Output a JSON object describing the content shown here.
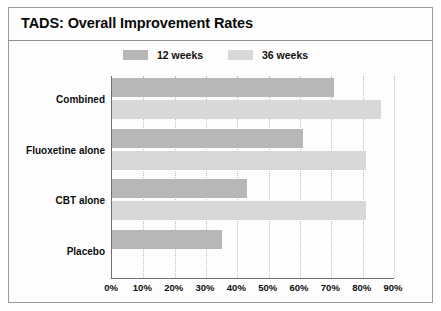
{
  "chart_data": {
    "type": "bar",
    "orientation": "horizontal",
    "title": "TADS: Overall Improvement Rates",
    "xlabel": "",
    "ylabel": "",
    "xlim": [
      0,
      90
    ],
    "xticks": [
      "0%",
      "10%",
      "20%",
      "30%",
      "40%",
      "50%",
      "60%",
      "70%",
      "80%",
      "90%"
    ],
    "xtick_values": [
      0,
      10,
      20,
      30,
      40,
      50,
      60,
      70,
      80,
      90
    ],
    "grid": "vertical-dotted",
    "legend_position": "top-center",
    "categories": [
      "Combined",
      "Fluoxetine alone",
      "CBT alone",
      "Placebo"
    ],
    "series": [
      {
        "name": "12 weeks",
        "color": "#b7b7b7",
        "values": [
          71,
          61,
          43,
          35
        ]
      },
      {
        "name": "36 weeks",
        "color": "#d8d8d8",
        "values": [
          86,
          81,
          81,
          null
        ]
      }
    ]
  },
  "colors": {
    "series_12_weeks": "#b7b7b7",
    "series_36_weeks": "#d8d8d8",
    "axis": "#6f6f6f",
    "grid": "#bdbdbd",
    "text": "#0d0d0d",
    "frame": "#9a9a9a"
  }
}
